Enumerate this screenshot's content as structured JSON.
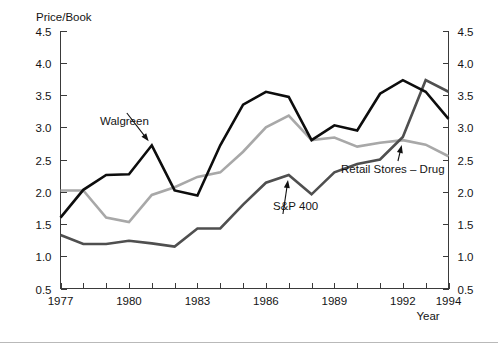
{
  "figure": {
    "y_axis_title": "Price/Book",
    "x_axis_title": "Year",
    "background_color": "#ffffff",
    "axis_color": "#3a3a3a"
  },
  "chart_data": {
    "type": "line",
    "title": "",
    "subtitle": "",
    "xlabel": "Year",
    "ylabel": "Price/Book",
    "xlim": [
      1977,
      1994
    ],
    "ylim": [
      0.5,
      4.5
    ],
    "grid": false,
    "legend_position": "inline-annotations",
    "y_ticks": [
      "0.5",
      "1.0",
      "1.5",
      "2.0",
      "2.5",
      "3.0",
      "3.5",
      "4.0",
      "4.5"
    ],
    "y_tick_values": [
      0.5,
      1.0,
      1.5,
      2.0,
      2.5,
      3.0,
      3.5,
      4.0,
      4.5
    ],
    "y_axis_duplicated_right": true,
    "x_ticks_all_years": [
      1977,
      1978,
      1979,
      1980,
      1981,
      1982,
      1983,
      1984,
      1985,
      1986,
      1987,
      1988,
      1989,
      1990,
      1991,
      1992,
      1993,
      1994
    ],
    "x_tick_labels": [
      "1977",
      "1980",
      "1983",
      "1986",
      "1989",
      "1992",
      "1994"
    ],
    "x_tick_label_years": [
      1977,
      1980,
      1983,
      1986,
      1989,
      1992,
      1994
    ],
    "x": [
      1977,
      1978,
      1979,
      1980,
      1981,
      1982,
      1983,
      1984,
      1985,
      1986,
      1987,
      1988,
      1989,
      1990,
      1991,
      1992,
      1993,
      1994
    ],
    "series": [
      {
        "name": "Walgreen",
        "color": "#0d0d0d",
        "width": 2.6,
        "values": [
          1.6,
          2.03,
          2.26,
          2.27,
          2.72,
          2.02,
          1.94,
          2.72,
          3.35,
          3.55,
          3.47,
          2.8,
          3.03,
          2.95,
          3.52,
          3.73,
          3.55,
          3.13
        ]
      },
      {
        "name": "Retail Stores – Drug",
        "color": "#a8a8a8",
        "width": 2.6,
        "values": [
          2.02,
          2.02,
          1.6,
          1.53,
          1.95,
          2.07,
          2.23,
          2.3,
          2.62,
          3.0,
          3.18,
          2.8,
          2.84,
          2.7,
          2.76,
          2.8,
          2.73,
          2.55
        ]
      },
      {
        "name": "S&P 400",
        "color": "#4f4f4f",
        "width": 2.6,
        "values": [
          1.33,
          1.19,
          1.19,
          1.24,
          1.2,
          1.15,
          1.43,
          1.43,
          1.8,
          2.14,
          2.26,
          1.96,
          2.3,
          2.43,
          2.5,
          2.85,
          3.73,
          3.55
        ]
      }
    ],
    "annotations": [
      {
        "text": "Walgreen",
        "target_year": 1981,
        "target_value": 2.72,
        "label_x": 100,
        "label_y": 125
      },
      {
        "text": "S&P 400",
        "target_year": 1987,
        "target_value": 2.26,
        "label_x": 273,
        "label_y": 210
      },
      {
        "text": "Retail Stores – Drug",
        "target_year": 1992,
        "target_value": 2.8,
        "label_x": 341,
        "label_y": 173
      }
    ]
  }
}
